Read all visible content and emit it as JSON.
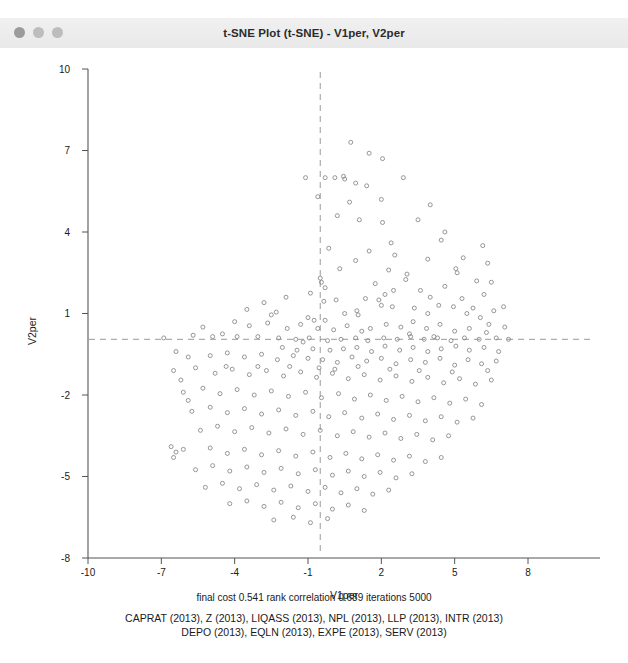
{
  "window": {
    "title": "t-SNE Plot (t-SNE) - V1per, V2per",
    "traffic_lights": [
      "close-dot",
      "minimize-dot",
      "zoom-dot"
    ],
    "chrome_color": "#efefef"
  },
  "caption": {
    "line1": "final cost  0.541   rank correlation   0.689   iterations   5000",
    "line2": "CAPRAT (2013), Z (2013), LIQASS (2013), NPL (2013), LLP (2013), INTR (2013)",
    "line3": "DEPO (2013), EQLN (2013), EXPE (2013), SERV (2013)"
  },
  "chart_data": {
    "type": "scatter",
    "title": "t-SNE Plot (t-SNE) - V1per, V2per",
    "xlabel": "V1per",
    "ylabel": "V2per",
    "xlim": [
      -10,
      9.5
    ],
    "ylim": [
      -8,
      10
    ],
    "xticks": [
      -10,
      -7,
      -4,
      -1,
      2,
      5,
      8
    ],
    "yticks": [
      -8,
      -5,
      -2,
      1,
      4,
      7,
      10
    ],
    "grid": false,
    "legend": "none",
    "marker": {
      "shape": "open-circle",
      "size": 4,
      "color": "#8a8a8a",
      "fill": "none"
    },
    "reference_lines": [
      {
        "orientation": "vertical",
        "value": -0.5,
        "style": "dashed",
        "color": "#9a9a9a"
      },
      {
        "orientation": "horizontal",
        "value": 0.05,
        "style": "dashed",
        "color": "#9a9a9a"
      }
    ],
    "n_points": 283,
    "points": [
      [
        -1.1,
        6.0
      ],
      [
        -0.3,
        6.0
      ],
      [
        0.1,
        6.0
      ],
      [
        0.45,
        6.05
      ],
      [
        0.5,
        5.95
      ],
      [
        0.95,
        5.8
      ],
      [
        1.4,
        5.7
      ],
      [
        2.9,
        6.0
      ],
      [
        0.7,
        5.1
      ],
      [
        1.1,
        4.45
      ],
      [
        2.05,
        4.35
      ],
      [
        3.5,
        4.45
      ],
      [
        4.6,
        4.0
      ],
      [
        4.45,
        3.7
      ],
      [
        0.95,
        2.95
      ],
      [
        2.55,
        3.15
      ],
      [
        2.3,
        2.6
      ],
      [
        -0.5,
        2.3
      ],
      [
        -0.45,
        2.15
      ],
      [
        -0.3,
        1.95
      ],
      [
        3.05,
        2.45
      ],
      [
        3.0,
        2.25
      ],
      [
        5.05,
        2.65
      ],
      [
        5.1,
        2.5
      ],
      [
        6.15,
        3.5
      ],
      [
        5.9,
        2.2
      ],
      [
        6.5,
        2.15
      ],
      [
        -2.3,
        1.05
      ],
      [
        -1.0,
        0.85
      ],
      [
        -0.75,
        0.75
      ],
      [
        -0.3,
        0.75
      ],
      [
        0.5,
        1.0
      ],
      [
        1.0,
        1.1
      ],
      [
        1.05,
        0.95
      ],
      [
        2.0,
        1.3
      ],
      [
        2.5,
        1.85
      ],
      [
        3.6,
        1.85
      ],
      [
        4.0,
        1.6
      ],
      [
        4.6,
        2.0
      ],
      [
        5.3,
        1.55
      ],
      [
        6.2,
        1.7
      ],
      [
        6.6,
        1.1
      ],
      [
        7.0,
        1.25
      ],
      [
        -0.35,
        1.45
      ],
      [
        0.15,
        1.5
      ],
      [
        1.35,
        1.55
      ],
      [
        1.9,
        1.5
      ],
      [
        2.45,
        1.25
      ],
      [
        3.35,
        1.2
      ],
      [
        3.9,
        1.0
      ],
      [
        4.35,
        1.3
      ],
      [
        5.5,
        1.0
      ],
      [
        6.05,
        0.85
      ],
      [
        -0.6,
        0.45
      ],
      [
        0.05,
        0.4
      ],
      [
        0.6,
        0.55
      ],
      [
        1.2,
        0.35
      ],
      [
        1.55,
        0.45
      ],
      [
        2.2,
        0.6
      ],
      [
        2.8,
        0.5
      ],
      [
        3.3,
        0.7
      ],
      [
        3.85,
        0.45
      ],
      [
        4.4,
        0.6
      ],
      [
        5.0,
        0.35
      ],
      [
        5.6,
        0.45
      ],
      [
        6.3,
        0.3
      ],
      [
        7.05,
        0.5
      ],
      [
        -3.05,
        0.15
      ],
      [
        -2.2,
        0.1
      ],
      [
        -1.5,
        0.05
      ],
      [
        -0.95,
        0.1
      ],
      [
        -0.2,
        0.0
      ],
      [
        0.35,
        0.05
      ],
      [
        0.95,
        0.1
      ],
      [
        1.45,
        0.0
      ],
      [
        2.1,
        0.1
      ],
      [
        2.65,
        0.05
      ],
      [
        3.2,
        0.15
      ],
      [
        3.75,
        0.05
      ],
      [
        4.3,
        0.1
      ],
      [
        4.85,
        0.0
      ],
      [
        5.4,
        0.1
      ],
      [
        6.0,
        0.05
      ],
      [
        6.7,
        0.1
      ],
      [
        7.2,
        0.05
      ],
      [
        -6.9,
        0.1
      ],
      [
        -5.3,
        0.5
      ],
      [
        -4.5,
        0.25
      ],
      [
        -4.0,
        0.7
      ],
      [
        -3.4,
        0.55
      ],
      [
        -2.65,
        0.65
      ],
      [
        -1.85,
        0.45
      ],
      [
        -1.3,
        0.6
      ],
      [
        -0.8,
        -0.3
      ],
      [
        -0.1,
        -0.35
      ],
      [
        0.45,
        -0.3
      ],
      [
        1.0,
        -0.25
      ],
      [
        1.6,
        -0.4
      ],
      [
        2.15,
        -0.2
      ],
      [
        2.75,
        -0.35
      ],
      [
        3.3,
        -0.25
      ],
      [
        3.9,
        -0.4
      ],
      [
        4.45,
        -0.3
      ],
      [
        5.05,
        -0.2
      ],
      [
        5.6,
        -0.35
      ],
      [
        6.2,
        -0.25
      ],
      [
        6.8,
        -0.4
      ],
      [
        -5.9,
        -0.6
      ],
      [
        -5.0,
        -0.55
      ],
      [
        -4.3,
        -0.45
      ],
      [
        -3.6,
        -0.6
      ],
      [
        -2.9,
        -0.5
      ],
      [
        -2.25,
        -0.7
      ],
      [
        -1.6,
        -0.55
      ],
      [
        -1.0,
        -0.65
      ],
      [
        -0.4,
        -0.7
      ],
      [
        0.2,
        -0.8
      ],
      [
        0.8,
        -0.6
      ],
      [
        1.4,
        -0.75
      ],
      [
        2.0,
        -0.65
      ],
      [
        2.6,
        -0.85
      ],
      [
        3.2,
        -0.7
      ],
      [
        3.8,
        -0.8
      ],
      [
        4.4,
        -0.65
      ],
      [
        5.0,
        -0.9
      ],
      [
        5.55,
        -0.7
      ],
      [
        6.1,
        -0.85
      ],
      [
        6.7,
        -0.75
      ],
      [
        -6.5,
        -1.1
      ],
      [
        -5.6,
        -1.0
      ],
      [
        -4.8,
        -1.2
      ],
      [
        -4.1,
        -1.05
      ],
      [
        -3.4,
        -1.25
      ],
      [
        -2.7,
        -1.1
      ],
      [
        -2.0,
        -1.3
      ],
      [
        -1.3,
        -1.15
      ],
      [
        -0.65,
        -1.35
      ],
      [
        0.0,
        -1.2
      ],
      [
        0.65,
        -1.4
      ],
      [
        1.3,
        -1.25
      ],
      [
        1.95,
        -1.45
      ],
      [
        2.6,
        -1.3
      ],
      [
        3.25,
        -1.5
      ],
      [
        3.9,
        -1.35
      ],
      [
        4.55,
        -1.55
      ],
      [
        5.2,
        -1.4
      ],
      [
        5.85,
        -1.6
      ],
      [
        6.5,
        -1.45
      ],
      [
        -6.1,
        -1.9
      ],
      [
        -5.3,
        -1.75
      ],
      [
        -4.6,
        -1.95
      ],
      [
        -3.9,
        -1.8
      ],
      [
        -3.2,
        -2.0
      ],
      [
        -2.5,
        -1.85
      ],
      [
        -1.8,
        -2.05
      ],
      [
        -1.1,
        -1.9
      ],
      [
        -0.45,
        -2.1
      ],
      [
        0.25,
        -1.95
      ],
      [
        0.9,
        -2.15
      ],
      [
        1.55,
        -2.0
      ],
      [
        2.2,
        -2.2
      ],
      [
        2.85,
        -2.05
      ],
      [
        3.5,
        -2.25
      ],
      [
        4.15,
        -2.1
      ],
      [
        4.8,
        -2.3
      ],
      [
        5.45,
        -2.15
      ],
      [
        6.1,
        -2.35
      ],
      [
        -5.75,
        -2.6
      ],
      [
        -5.0,
        -2.45
      ],
      [
        -4.3,
        -2.65
      ],
      [
        -3.6,
        -2.5
      ],
      [
        -2.9,
        -2.7
      ],
      [
        -2.2,
        -2.55
      ],
      [
        -1.5,
        -2.75
      ],
      [
        -0.8,
        -2.6
      ],
      [
        -0.15,
        -2.8
      ],
      [
        0.5,
        -2.65
      ],
      [
        1.2,
        -2.85
      ],
      [
        1.85,
        -2.7
      ],
      [
        2.5,
        -2.9
      ],
      [
        3.15,
        -2.75
      ],
      [
        3.8,
        -2.95
      ],
      [
        4.45,
        -2.8
      ],
      [
        5.1,
        -3.0
      ],
      [
        5.75,
        -2.85
      ],
      [
        -5.4,
        -3.3
      ],
      [
        -4.7,
        -3.15
      ],
      [
        -4.0,
        -3.35
      ],
      [
        -3.3,
        -3.2
      ],
      [
        -2.6,
        -3.4
      ],
      [
        -1.9,
        -3.25
      ],
      [
        -1.2,
        -3.45
      ],
      [
        -0.5,
        -3.3
      ],
      [
        0.2,
        -3.5
      ],
      [
        0.85,
        -3.35
      ],
      [
        1.5,
        -3.55
      ],
      [
        2.15,
        -3.4
      ],
      [
        2.8,
        -3.6
      ],
      [
        3.45,
        -3.45
      ],
      [
        4.1,
        -3.65
      ],
      [
        4.75,
        -3.5
      ],
      [
        -6.6,
        -3.9
      ],
      [
        -6.4,
        -4.1
      ],
      [
        -6.5,
        -4.3
      ],
      [
        -6.1,
        -4.0
      ],
      [
        -5.0,
        -3.95
      ],
      [
        -4.3,
        -4.15
      ],
      [
        -3.6,
        -4.0
      ],
      [
        -2.9,
        -4.2
      ],
      [
        -2.2,
        -4.05
      ],
      [
        -1.5,
        -4.25
      ],
      [
        -0.8,
        -4.1
      ],
      [
        -0.1,
        -4.3
      ],
      [
        0.55,
        -4.15
      ],
      [
        1.2,
        -4.35
      ],
      [
        1.85,
        -4.2
      ],
      [
        2.5,
        -4.4
      ],
      [
        3.15,
        -4.25
      ],
      [
        3.8,
        -4.45
      ],
      [
        4.45,
        -4.3
      ],
      [
        -5.6,
        -4.75
      ],
      [
        -4.9,
        -4.6
      ],
      [
        -4.2,
        -4.8
      ],
      [
        -3.5,
        -4.65
      ],
      [
        -2.8,
        -4.85
      ],
      [
        -2.1,
        -4.7
      ],
      [
        -1.4,
        -4.9
      ],
      [
        -0.7,
        -4.75
      ],
      [
        0.0,
        -4.95
      ],
      [
        0.65,
        -4.8
      ],
      [
        1.3,
        -5.0
      ],
      [
        1.95,
        -4.85
      ],
      [
        2.6,
        -5.05
      ],
      [
        3.25,
        -4.9
      ],
      [
        -5.2,
        -5.4
      ],
      [
        -4.5,
        -5.25
      ],
      [
        -3.8,
        -5.45
      ],
      [
        -3.1,
        -5.3
      ],
      [
        -2.4,
        -5.5
      ],
      [
        -1.7,
        -5.35
      ],
      [
        -1.0,
        -5.55
      ],
      [
        -0.3,
        -5.4
      ],
      [
        0.35,
        -5.6
      ],
      [
        1.0,
        -5.45
      ],
      [
        1.65,
        -5.65
      ],
      [
        2.3,
        -5.5
      ],
      [
        -4.2,
        -6.0
      ],
      [
        -3.5,
        -5.9
      ],
      [
        -2.8,
        -6.1
      ],
      [
        -2.1,
        -5.95
      ],
      [
        -1.4,
        -6.15
      ],
      [
        -0.7,
        -6.0
      ],
      [
        0.0,
        -6.2
      ],
      [
        0.65,
        -6.05
      ],
      [
        1.3,
        -6.25
      ],
      [
        -2.4,
        -6.6
      ],
      [
        -1.6,
        -6.5
      ],
      [
        -0.9,
        -6.7
      ],
      [
        -0.2,
        -6.55
      ],
      [
        -1.2,
        -0.05
      ],
      [
        -1.45,
        -0.35
      ],
      [
        -2.05,
        -0.25
      ],
      [
        0.3,
        2.65
      ],
      [
        1.75,
        2.1
      ],
      [
        2.15,
        1.7
      ],
      [
        3.15,
        0.25
      ],
      [
        4.15,
        0.15
      ],
      [
        4.95,
        1.25
      ],
      [
        5.75,
        1.2
      ],
      [
        6.4,
        0.6
      ],
      [
        -3.9,
        0.15
      ],
      [
        -4.9,
        0.15
      ],
      [
        -5.7,
        0.2
      ],
      [
        -6.4,
        -0.4
      ],
      [
        -6.2,
        -1.45
      ],
      [
        -5.9,
        -2.2
      ],
      [
        -0.55,
        -1.0
      ],
      [
        0.1,
        -1.05
      ],
      [
        1.05,
        -0.95
      ],
      [
        2.35,
        -1.05
      ],
      [
        3.55,
        -1.1
      ],
      [
        4.9,
        -1.15
      ],
      [
        6.35,
        -1.1
      ],
      [
        -1.75,
        -0.95
      ],
      [
        -3.05,
        -0.95
      ],
      [
        -4.35,
        -0.95
      ],
      [
        2.4,
        3.6
      ],
      [
        1.5,
        3.3
      ],
      [
        0.2,
        4.6
      ],
      [
        -0.15,
        3.4
      ],
      [
        3.9,
        3.0
      ],
      [
        5.35,
        3.05
      ],
      [
        6.35,
        2.85
      ],
      [
        -0.6,
        5.3
      ],
      [
        2.0,
        5.2
      ],
      [
        4.0,
        5.0
      ],
      [
        -2.8,
        1.4
      ],
      [
        -3.5,
        1.15
      ],
      [
        -2.5,
        0.95
      ],
      [
        -1.9,
        1.6
      ],
      [
        -0.9,
        1.75
      ],
      [
        0.75,
        7.3
      ],
      [
        1.5,
        6.9
      ],
      [
        2.05,
        6.7
      ]
    ]
  }
}
